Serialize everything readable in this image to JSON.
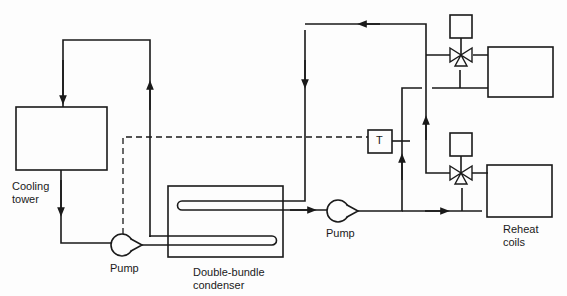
{
  "diagram": {
    "components": {
      "cooling_tower": {
        "label_line1": "Cooling",
        "label_line2": "tower"
      },
      "pump_1": {
        "label": "Pump"
      },
      "condenser": {
        "label_line1": "Double-bundle",
        "label_line2": "condenser"
      },
      "pump_2": {
        "label": "Pump"
      },
      "thermostat": {
        "label": "T"
      },
      "reheat_coils": {
        "label_line1": "Reheat",
        "label_line2": "coils"
      }
    },
    "colors": {
      "line": "#1a1a1a",
      "background": "#fdfdfd"
    }
  }
}
